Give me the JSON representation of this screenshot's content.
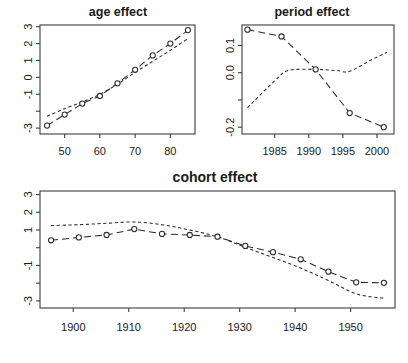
{
  "figure": {
    "width": 408,
    "height": 363,
    "background": "#ffffff",
    "ink_color": "#2a2a2a",
    "axis_color": "#3c3c3c"
  },
  "chart_data": [
    {
      "type": "line",
      "panel": "age",
      "title": "age effect",
      "xlabel": "",
      "ylabel": "",
      "xlim": [
        43,
        87
      ],
      "ylim": [
        -3.35,
        3.1
      ],
      "grid": false,
      "legend": "none",
      "xticks": [
        50,
        60,
        70,
        80
      ],
      "xtick_labels": [
        "50",
        "60",
        "70",
        "80"
      ],
      "yticks": [
        3,
        2,
        1,
        0,
        -1,
        -2,
        -3
      ],
      "ytick_labels": [
        "3",
        "2",
        "1",
        "0",
        "-1",
        "",
        "-3"
      ],
      "x": [
        45,
        50,
        55,
        60,
        65,
        70,
        75,
        80,
        85
      ],
      "series": [
        {
          "name": "estimate",
          "style": "dashed-with-circles",
          "markers": true,
          "values": [
            -2.85,
            -2.2,
            -1.55,
            -1.1,
            -0.35,
            0.45,
            1.3,
            2.0,
            2.8
          ]
        },
        {
          "name": "fitted",
          "style": "fine-dashed",
          "markers": false,
          "values": [
            -2.3,
            -1.85,
            -1.45,
            -1.0,
            -0.4,
            0.3,
            0.95,
            1.6,
            2.3
          ]
        }
      ]
    },
    {
      "type": "line",
      "panel": "period",
      "title": "period effect",
      "xlabel": "",
      "ylabel": "",
      "xlim": [
        1980.2,
        2002.5
      ],
      "ylim": [
        -0.225,
        0.175
      ],
      "grid": false,
      "legend": "none",
      "xticks": [
        1985,
        1990,
        1995,
        2000
      ],
      "xtick_labels": [
        "1985",
        "1990",
        "1995",
        "2000"
      ],
      "yticks": [
        0.1,
        0.0,
        -0.1,
        -0.2
      ],
      "ytick_labels": [
        "0.1",
        "0.0",
        "",
        "-0.2"
      ],
      "x": [
        1981,
        1986,
        1991,
        1996,
        2001
      ],
      "series": [
        {
          "name": "estimate",
          "style": "dashed-with-circles",
          "markers": true,
          "values": [
            0.158,
            0.133,
            0.012,
            -0.148,
            -0.2
          ]
        },
        {
          "name": "fitted",
          "style": "fine-dashed",
          "markers": false,
          "values": [
            -0.128,
            -0.03,
            0.008,
            0.012,
            0.008,
            0.005,
            0.045,
            0.075
          ]
        }
      ],
      "fitted_x": [
        1981,
        1985,
        1987,
        1991,
        1994,
        1996,
        1999,
        2001.5
      ]
    },
    {
      "type": "line",
      "panel": "cohort",
      "title": "cohort effect",
      "xlabel": "",
      "ylabel": "",
      "xlim": [
        1894,
        1958
      ],
      "ylim": [
        -3.4,
        3.2
      ],
      "grid": false,
      "legend": "none",
      "xticks": [
        1900,
        1910,
        1920,
        1930,
        1940,
        1950
      ],
      "xtick_labels": [
        "1900",
        "1910",
        "1920",
        "1930",
        "1940",
        "1950"
      ],
      "yticks": [
        3,
        2,
        1,
        0,
        -1,
        -2,
        -3
      ],
      "ytick_labels": [
        "3",
        "2",
        "1",
        "",
        "-1",
        "",
        "-3"
      ],
      "x": [
        1896,
        1901,
        1906,
        1911,
        1916,
        1921,
        1926,
        1931,
        1936,
        1941,
        1946,
        1951,
        1956
      ],
      "series": [
        {
          "name": "estimate",
          "style": "dashed-with-circles",
          "markers": true,
          "values": [
            0.42,
            0.58,
            0.72,
            1.05,
            0.78,
            0.72,
            0.62,
            0.1,
            -0.25,
            -0.65,
            -1.35,
            -1.95,
            -1.98
          ]
        },
        {
          "name": "fitted",
          "style": "fine-dashed",
          "markers": false,
          "values": [
            1.25,
            1.3,
            1.38,
            1.45,
            1.3,
            1.0,
            0.62,
            0.02,
            -0.55,
            -1.15,
            -1.85,
            -2.6,
            -2.85
          ]
        }
      ]
    }
  ]
}
